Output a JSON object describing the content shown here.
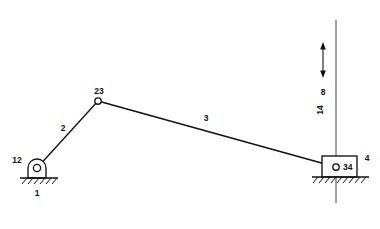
{
  "diagram": {
    "type": "kinematic-linkage",
    "colors": {
      "line": "#111111",
      "background": "#ffffff",
      "guide": "#555555"
    },
    "labels": {
      "ground_pivot_joint": "12",
      "ground_link": "1",
      "crank_link": "2",
      "apex_joint": "23",
      "coupler_link": "3",
      "slider_joint": "34",
      "slider_link": "4",
      "arrow_value": "8",
      "guide_label": "14"
    },
    "geometry": {
      "ground_pin": {
        "x": 37,
        "y": 168
      },
      "apex_pin": {
        "x": 98,
        "y": 101
      },
      "slider_pin": {
        "x": 336,
        "y": 167
      },
      "left_ground_line": {
        "x1": 20,
        "x2": 58,
        "y": 178
      },
      "right_ground_line": {
        "x1": 312,
        "x2": 369,
        "y": 177
      },
      "slider_box": {
        "x": 322,
        "y": 156,
        "width": 35,
        "height": 21
      },
      "guide_line": {
        "x": 336,
        "y1": 20,
        "y2": 203
      },
      "arrow": {
        "x": 323,
        "y_top": 45,
        "y_bottom": 75
      }
    },
    "label_positions": {
      "ground_pivot_joint": {
        "x": 17,
        "y": 163
      },
      "ground_link": {
        "x": 37,
        "y": 196
      },
      "crank_link": {
        "x": 63,
        "y": 131
      },
      "apex_joint": {
        "x": 99,
        "y": 94
      },
      "coupler_link": {
        "x": 206,
        "y": 121
      },
      "slider_joint": {
        "x": 343,
        "y": 170
      },
      "slider_link": {
        "x": 367,
        "y": 160
      },
      "arrow_value": {
        "x": 323,
        "y": 92
      },
      "guide_label": {
        "x": 323,
        "y": 110
      }
    }
  }
}
